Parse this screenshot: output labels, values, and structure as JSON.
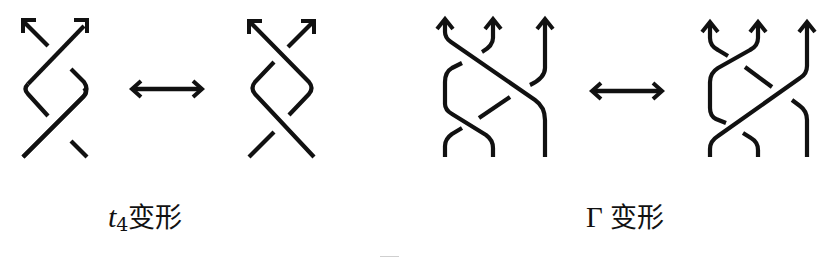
{
  "figure": {
    "type": "braid-move-diagram",
    "stroke_color": "#111111",
    "background": "#ffffff",
    "panels": [
      {
        "id": "t4",
        "label": {
          "symbol": "t",
          "subscript": "4",
          "text": "变形"
        },
        "before": {
          "strands": 2,
          "crossings": 2,
          "description": "two-strand braid, two crossings, strands oriented upward"
        },
        "relation": "double-arrow",
        "after": {
          "strands": 2,
          "crossings": 2,
          "description": "mirrored two-strand braid, two crossings, strands oriented upward"
        }
      },
      {
        "id": "gamma",
        "label": {
          "symbol": "Γ",
          "text": "变形"
        },
        "before": {
          "strands": 3,
          "crossings": 3,
          "description": "three-strand braid, three crossings, strands oriented upward"
        },
        "relation": "double-arrow",
        "after": {
          "strands": 3,
          "crossings": 3,
          "description": "three-strand braid after Γ move, three crossings, strands oriented upward"
        }
      }
    ]
  }
}
